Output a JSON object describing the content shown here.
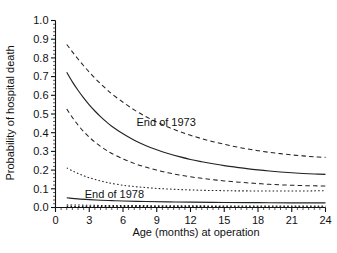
{
  "chart_data": {
    "type": "line",
    "title": "",
    "xlabel": "Age (months) at operation",
    "ylabel": "Probability of hospital death",
    "xlim": [
      0,
      24
    ],
    "ylim": [
      0,
      1.0
    ],
    "grid": false,
    "legend_position": "inline-annotation",
    "x_ticks": [
      "0",
      "3",
      "6",
      "9",
      "12",
      "15",
      "18",
      "21",
      "24"
    ],
    "x_tick_values": [
      0,
      3,
      6,
      9,
      12,
      15,
      18,
      21,
      24
    ],
    "y_ticks": [
      "0.0",
      "0.1",
      "0.2",
      "0.3",
      "0.4",
      "0.5",
      "0.6",
      "0.7",
      "0.8",
      "0.9",
      "1.0"
    ],
    "y_tick_values": [
      0.0,
      0.1,
      0.2,
      0.3,
      0.4,
      0.5,
      0.6,
      0.7,
      0.8,
      0.9,
      1.0
    ],
    "x_minor_interval": 0.5,
    "y_minor_interval": 0.02,
    "annotations": [
      {
        "text": "End of 1973",
        "x": 7.2,
        "y": 0.455
      },
      {
        "text": "End of 1978",
        "x": 2.6,
        "y": 0.073
      }
    ],
    "series": [
      {
        "name": "End of 1973 estimate",
        "style": "solid",
        "x": [
          1,
          1.5,
          2,
          2.5,
          3,
          3.5,
          4,
          4.5,
          5,
          6,
          7,
          8,
          9,
          10,
          11,
          12,
          13,
          14,
          15,
          16,
          17,
          18,
          19,
          20,
          21,
          22,
          23,
          24
        ],
        "values": [
          0.723,
          0.672,
          0.627,
          0.586,
          0.549,
          0.516,
          0.486,
          0.459,
          0.435,
          0.394,
          0.36,
          0.332,
          0.309,
          0.289,
          0.272,
          0.257,
          0.245,
          0.234,
          0.224,
          0.216,
          0.208,
          0.201,
          0.195,
          0.19,
          0.186,
          0.182,
          0.179,
          0.177
        ]
      },
      {
        "name": "End of 1973 upper limit",
        "style": "dashed",
        "x": [
          1,
          1.5,
          2,
          2.5,
          3,
          3.5,
          4,
          4.5,
          5,
          6,
          7,
          8,
          9,
          10,
          11,
          12,
          13,
          14,
          15,
          16,
          17,
          18,
          19,
          20,
          21,
          22,
          23,
          24
        ],
        "values": [
          0.872,
          0.832,
          0.794,
          0.758,
          0.724,
          0.692,
          0.662,
          0.634,
          0.608,
          0.563,
          0.522,
          0.487,
          0.457,
          0.43,
          0.407,
          0.386,
          0.368,
          0.352,
          0.338,
          0.325,
          0.314,
          0.304,
          0.295,
          0.288,
          0.281,
          0.276,
          0.271,
          0.268
        ]
      },
      {
        "name": "End of 1973 lower limit",
        "style": "dashed",
        "x": [
          1,
          1.5,
          2,
          2.5,
          3,
          3.5,
          4,
          4.5,
          5,
          6,
          7,
          8,
          9,
          10,
          11,
          12,
          13,
          14,
          15,
          16,
          17,
          18,
          19,
          20,
          21,
          22,
          23,
          24
        ],
        "values": [
          0.527,
          0.481,
          0.441,
          0.406,
          0.376,
          0.35,
          0.327,
          0.307,
          0.289,
          0.26,
          0.236,
          0.216,
          0.2,
          0.186,
          0.174,
          0.164,
          0.156,
          0.149,
          0.142,
          0.137,
          0.132,
          0.128,
          0.124,
          0.121,
          0.119,
          0.117,
          0.116,
          0.115
        ]
      },
      {
        "name": "End of 1978 estimate",
        "style": "solid",
        "x": [
          1,
          2,
          3,
          4,
          5,
          6,
          8,
          10,
          12,
          15,
          18,
          21,
          24
        ],
        "values": [
          0.052,
          0.046,
          0.042,
          0.039,
          0.037,
          0.035,
          0.032,
          0.03,
          0.029,
          0.027,
          0.026,
          0.025,
          0.025
        ]
      },
      {
        "name": "End of 1978 upper limit",
        "style": "dotted",
        "x": [
          1,
          1.5,
          2,
          2.5,
          3,
          3.5,
          4,
          4.5,
          5,
          6,
          7,
          8,
          9,
          10,
          11,
          12,
          13,
          14,
          15,
          16,
          17,
          18,
          19,
          20,
          21,
          22,
          23,
          24
        ],
        "values": [
          0.212,
          0.196,
          0.182,
          0.17,
          0.159,
          0.15,
          0.142,
          0.135,
          0.129,
          0.119,
          0.112,
          0.107,
          0.102,
          0.099,
          0.096,
          0.094,
          0.092,
          0.091,
          0.09,
          0.089,
          0.089,
          0.088,
          0.088,
          0.088,
          0.088,
          0.088,
          0.089,
          0.09
        ]
      },
      {
        "name": "End of 1978 lower limit",
        "style": "dotted",
        "x": [
          1,
          2,
          3,
          4,
          5,
          6,
          8,
          10,
          12,
          15,
          18,
          21,
          24
        ],
        "values": [
          0.014,
          0.013,
          0.012,
          0.011,
          0.011,
          0.01,
          0.01,
          0.009,
          0.009,
          0.008,
          0.008,
          0.008,
          0.008
        ]
      },
      {
        "name": "baseline dotted trace",
        "style": "dotted",
        "x": [
          1,
          6,
          12,
          18,
          24
        ],
        "values": [
          0.006,
          0.005,
          0.005,
          0.004,
          0.004
        ]
      }
    ]
  }
}
